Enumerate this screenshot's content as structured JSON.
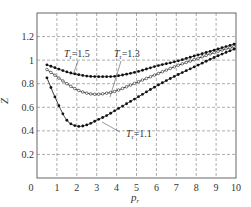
{
  "chart_data": {
    "type": "line",
    "title": "",
    "xlabel": "p_r",
    "ylabel": "Z",
    "xlim": [
      0,
      10
    ],
    "ylim": [
      0,
      1.4
    ],
    "grid": true,
    "x_ticks": [
      "0",
      "1",
      "2",
      "3",
      "4",
      "5",
      "6",
      "7",
      "8",
      "9",
      "10"
    ],
    "y_ticks": [
      "0.2",
      "0.4",
      "0.6",
      "0.8",
      "1",
      "1.2"
    ],
    "legend": "inline annotations",
    "series": [
      {
        "name": "T_r = 1.5",
        "marker": "filled-dot",
        "x": [
          0.5,
          1,
          1.5,
          2,
          2.5,
          3,
          3.5,
          4,
          5,
          6,
          7,
          8,
          9,
          10
        ],
        "values": [
          0.96,
          0.93,
          0.9,
          0.88,
          0.865,
          0.86,
          0.86,
          0.865,
          0.9,
          0.95,
          0.99,
          1.04,
          1.09,
          1.14
        ]
      },
      {
        "name": "T_r = 1.3",
        "marker": "open-circle",
        "x": [
          0.5,
          1,
          1.5,
          2,
          2.5,
          3,
          3.5,
          4,
          5,
          6,
          7,
          8,
          9,
          10
        ],
        "values": [
          0.92,
          0.86,
          0.8,
          0.75,
          0.72,
          0.71,
          0.72,
          0.74,
          0.81,
          0.88,
          0.95,
          1.01,
          1.07,
          1.12
        ]
      },
      {
        "name": "T_r = 1.1",
        "marker": "filled-dot",
        "x": [
          0.5,
          1,
          1.5,
          2,
          2.5,
          3,
          3.5,
          4,
          5,
          6,
          7,
          8,
          9,
          10
        ],
        "values": [
          0.85,
          0.65,
          0.49,
          0.44,
          0.45,
          0.49,
          0.53,
          0.58,
          0.68,
          0.78,
          0.87,
          0.95,
          1.03,
          1.1
        ]
      }
    ],
    "annotations": [
      {
        "text": "T_r = 1.5",
        "points_to": "T_r = 1.5 curve near p_r = 2"
      },
      {
        "text": "T_r = 1.3",
        "points_to": "T_r = 1.3 curve near p_r = 3.7"
      },
      {
        "text": "T_r = 1.1",
        "points_to": "T_r = 1.1 curve near p_r = 3.3"
      }
    ]
  },
  "labels": {
    "ylabel": "Z",
    "xlabel_main": "p",
    "xlabel_sub": "r",
    "ann1_main": "T",
    "ann1_sub": "r",
    "ann1_val": "=1.5",
    "ann2_main": "T",
    "ann2_sub": "r",
    "ann2_val": "=1.3",
    "ann3_main": "T",
    "ann3_sub": "r",
    "ann3_val": "=1.1"
  }
}
